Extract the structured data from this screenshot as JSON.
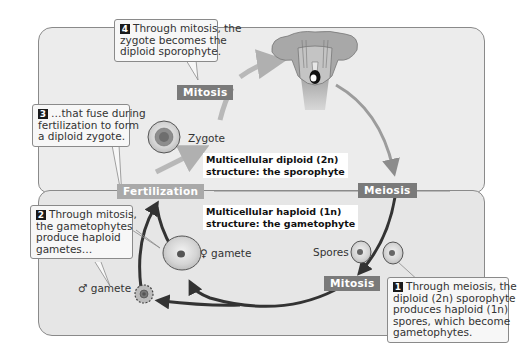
{
  "diagram": {
    "colors": {
      "panel_top": "#ececec",
      "panel_bottom": "#e6e6e6",
      "panel_border": "#8a8a8a",
      "stage_label_bg": "#8c8c8c",
      "arrow_dark": "#333333",
      "arrow_light": "#b0b0b0",
      "step_badge": "#1a1a1a"
    }
  },
  "structures": {
    "sporophyte": {
      "line1": "Multicellular diploid (2n)",
      "line2": "structure: the sporophyte"
    },
    "gametophyte": {
      "line1": "Multicellular haploid (1n)",
      "line2": "structure: the gametophyte"
    }
  },
  "stages": {
    "mitosis_top": "Mitosis",
    "meiosis": "Meiosis",
    "mitosis_bottom": "Mitosis",
    "fertilization": "Fertilization"
  },
  "cells": {
    "zygote": "Zygote",
    "female_gamete": "♀ gamete",
    "male_gamete": "♂ gamete",
    "spores": "Spores"
  },
  "callouts": [
    {
      "step": "1",
      "lines": [
        "Through meiosis, the",
        "diploid (2n) sporophyte",
        "produces haploid (1n)",
        "spores, which become",
        "gametophytes."
      ]
    },
    {
      "step": "2",
      "lines": [
        "Through mitosis,",
        "the gametophytes",
        "produce haploid",
        "gametes…"
      ]
    },
    {
      "step": "3",
      "lines": [
        "…that fuse during",
        "fertilization to form",
        "a diploid zygote."
      ]
    },
    {
      "step": "4",
      "lines": [
        "Through mitosis, the",
        "zygote becomes the",
        "diploid sporophyte."
      ]
    }
  ]
}
